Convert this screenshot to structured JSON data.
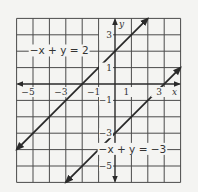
{
  "chart_data": {
    "type": "line",
    "title": "",
    "xlabel": "x",
    "ylabel": "y",
    "xlim": [
      -6,
      4
    ],
    "ylim": [
      -6,
      4
    ],
    "grid": true,
    "grid_step": 1,
    "x_ticks": [
      {
        "value": -5,
        "label": "−5"
      },
      {
        "value": -3,
        "label": "−3"
      },
      {
        "value": -1,
        "label": "−1"
      },
      {
        "value": 1,
        "label": "1"
      },
      {
        "value": 3,
        "label": "3"
      }
    ],
    "y_ticks": [
      {
        "value": 3,
        "label": "3"
      },
      {
        "value": 1,
        "label": "1"
      },
      {
        "value": -1,
        "label": "−1"
      },
      {
        "value": -3,
        "label": "−3"
      },
      {
        "value": -5,
        "label": "−5"
      }
    ],
    "series": [
      {
        "name": "−x + y = 2",
        "equation": "y = x + 2",
        "points": [
          [
            -6,
            -4
          ],
          [
            2,
            4
          ]
        ],
        "label": "−x + y = 2",
        "label_anchor": [
          -5.2,
          1.8
        ]
      },
      {
        "name": "−x + y = −3",
        "equation": "y = x − 3",
        "points": [
          [
            -3,
            -6
          ],
          [
            4,
            1
          ]
        ],
        "label": "−x + y = −3",
        "label_anchor": [
          -1.0,
          -4.2
        ]
      }
    ]
  }
}
